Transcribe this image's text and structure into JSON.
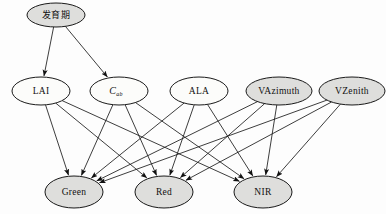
{
  "diagram": {
    "type": "directed-acyclic-graph",
    "canvas": {
      "width": 386,
      "height": 214
    },
    "style": {
      "shaded_fill": "#dededc",
      "plain_fill": "#fcfcfa",
      "stroke": "#1a1a1a",
      "edge_stroke": "#1b1b1b",
      "background": "#fdfdfd"
    },
    "nodes": [
      {
        "id": "phenology",
        "label": "发育期",
        "sub": "",
        "cx": 56,
        "cy": 15,
        "rx": 29,
        "ry": 12,
        "shaded": true,
        "script": "cjk",
        "layer": 0
      },
      {
        "id": "lai",
        "label": "LAI",
        "sub": "",
        "cx": 41,
        "cy": 91,
        "rx": 29,
        "ry": 14,
        "shaded": false,
        "script": "latin",
        "layer": 1
      },
      {
        "id": "cab",
        "label": "C",
        "sub": "ab",
        "cx": 119,
        "cy": 91,
        "rx": 29,
        "ry": 14,
        "shaded": false,
        "script": "italic",
        "layer": 1
      },
      {
        "id": "ala",
        "label": "ALA",
        "sub": "",
        "cx": 199,
        "cy": 91,
        "rx": 29,
        "ry": 14,
        "shaded": false,
        "script": "latin",
        "layer": 1
      },
      {
        "id": "vazimuth",
        "label": "VAzimuth",
        "sub": "",
        "cx": 279,
        "cy": 91,
        "rx": 33,
        "ry": 14,
        "shaded": true,
        "script": "latin",
        "layer": 1
      },
      {
        "id": "vzenith",
        "label": "VZenith",
        "sub": "",
        "cx": 352,
        "cy": 91,
        "rx": 33,
        "ry": 14,
        "shaded": true,
        "script": "latin",
        "layer": 1
      },
      {
        "id": "green",
        "label": "Green",
        "sub": "",
        "cx": 74,
        "cy": 192,
        "rx": 29,
        "ry": 16,
        "shaded": true,
        "script": "latin",
        "layer": 2
      },
      {
        "id": "red",
        "label": "Red",
        "sub": "",
        "cx": 164,
        "cy": 192,
        "rx": 29,
        "ry": 16,
        "shaded": true,
        "script": "latin",
        "layer": 2
      },
      {
        "id": "nir",
        "label": "NIR",
        "sub": "",
        "cx": 263,
        "cy": 192,
        "rx": 29,
        "ry": 16,
        "shaded": true,
        "script": "latin",
        "layer": 2
      }
    ],
    "edges": [
      {
        "from": "phenology",
        "to": "lai"
      },
      {
        "from": "phenology",
        "to": "cab"
      },
      {
        "from": "lai",
        "to": "green"
      },
      {
        "from": "lai",
        "to": "red"
      },
      {
        "from": "lai",
        "to": "nir"
      },
      {
        "from": "cab",
        "to": "green"
      },
      {
        "from": "cab",
        "to": "red"
      },
      {
        "from": "cab",
        "to": "nir"
      },
      {
        "from": "ala",
        "to": "green"
      },
      {
        "from": "ala",
        "to": "red"
      },
      {
        "from": "ala",
        "to": "nir"
      },
      {
        "from": "vazimuth",
        "to": "green"
      },
      {
        "from": "vazimuth",
        "to": "red"
      },
      {
        "from": "vazimuth",
        "to": "nir"
      },
      {
        "from": "vzenith",
        "to": "green"
      },
      {
        "from": "vzenith",
        "to": "red"
      },
      {
        "from": "vzenith",
        "to": "nir"
      }
    ]
  }
}
